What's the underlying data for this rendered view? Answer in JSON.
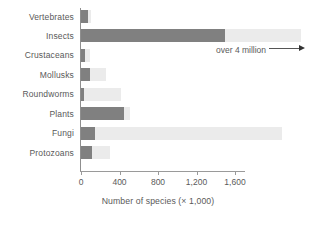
{
  "chart_data": {
    "type": "bar",
    "orientation": "horizontal",
    "title": "",
    "xlabel": "Number of species (× 1,000)",
    "ylabel": "",
    "xlim": [
      0,
      1700
    ],
    "grid": false,
    "legend": null,
    "categories": [
      "Vertebrates",
      "Insects",
      "Crustaceans",
      "Mollusks",
      "Roundworms",
      "Plants",
      "Fungi",
      "Protozoans"
    ],
    "values": [
      70,
      1500,
      40,
      90,
      25,
      450,
      150,
      110
    ],
    "tick_labels": [
      "0",
      "400",
      "800",
      "1,200",
      "1,600"
    ],
    "tick_values": [
      0,
      400,
      800,
      1200,
      1600
    ],
    "annotations": [
      {
        "text": "over 4 million",
        "target_category": "Insects",
        "arrow": "right"
      }
    ],
    "colors": {
      "bar": "#808080",
      "track": "#ebebeb",
      "axis": "#8f8f8f",
      "text": "#5a5a5a"
    }
  },
  "bars": [
    {
      "label": "Vertebrates",
      "value": 70,
      "track": 100
    },
    {
      "label": "Insects",
      "value": 1500,
      "track": 2290
    },
    {
      "label": "Crustaceans",
      "value": 40,
      "track": 95
    },
    {
      "label": "Mollusks",
      "value": 90,
      "track": 260
    },
    {
      "label": "Roundworms",
      "value": 25,
      "track": 420
    },
    {
      "label": "Plants",
      "value": 450,
      "track": 510
    },
    {
      "label": "Fungi",
      "value": 150,
      "track": 2090
    },
    {
      "label": "Protozoans",
      "value": 110,
      "track": 300
    }
  ],
  "axis": {
    "x_title": "Number of species (× 1,000)",
    "ticks": [
      "0",
      "400",
      "800",
      "1,200",
      "1,600"
    ]
  },
  "annotation": {
    "text": "over 4 million"
  },
  "caption": {
    "text": ""
  }
}
